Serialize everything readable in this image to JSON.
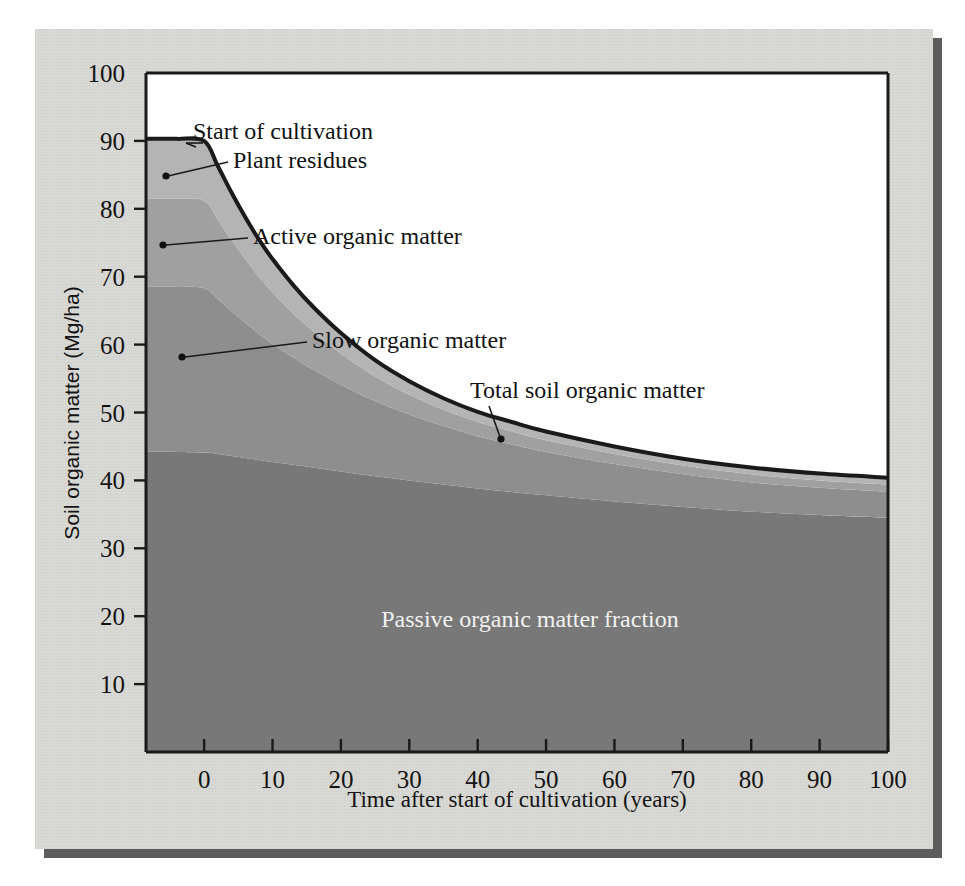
{
  "figure": {
    "caption_present": false,
    "background_color": "#d9d9d5",
    "plot_background": "#ffffff"
  },
  "axes": {
    "y_title": "Soil organic matter (Mg/ha)",
    "x_title": "Time after start of cultivation (years)",
    "y_ticks": [
      "10",
      "20",
      "30",
      "40",
      "50",
      "60",
      "70",
      "80",
      "90",
      "100"
    ],
    "x_ticks": [
      "0",
      "10",
      "20",
      "30",
      "40",
      "50",
      "60",
      "70",
      "80",
      "90",
      "100"
    ]
  },
  "annotations": {
    "start_of_cultivation": "Start of cultivation",
    "plant_residues": "Plant residues",
    "active_organic_matter": "Active organic matter",
    "slow_organic_matter": "Slow organic matter",
    "total_soil_organic_matter": "Total soil organic matter",
    "passive_organic_matter": "Passive organic matter fraction"
  },
  "colors": {
    "plant_residues": "#b4b4b4",
    "active": "#a0a0a0",
    "slow": "#8e8e8e",
    "passive": "#787878",
    "outline": "#1a1a1a",
    "paper": "#d9d9d5",
    "shadow": "#5c5c5c"
  },
  "chart_data": {
    "type": "area",
    "title": "",
    "subtitle": "",
    "xlabel": "Time after start of cultivation (years)",
    "ylabel": "Soil organic matter (Mg/ha)",
    "xlim": [
      -8.5,
      100
    ],
    "ylim": [
      0,
      100
    ],
    "grid": false,
    "legend": "in-plot annotations with leader lines",
    "stacked": true,
    "stack_order_bottom_to_top": [
      "Passive organic matter fraction",
      "Slow organic matter",
      "Active organic matter",
      "Plant residues"
    ],
    "x": [
      -8.5,
      -4,
      0,
      2,
      4,
      6,
      8,
      10,
      13,
      16,
      20,
      25,
      30,
      35,
      40,
      45,
      50,
      60,
      70,
      80,
      90,
      100
    ],
    "series": [
      {
        "name": "Passive organic matter fraction",
        "color": "#787878",
        "values": [
          44.2,
          44.2,
          44.1,
          43.9,
          43.6,
          43.3,
          43.0,
          42.7,
          42.3,
          41.9,
          41.3,
          40.6,
          40.0,
          39.4,
          38.8,
          38.3,
          37.8,
          36.9,
          36.1,
          35.4,
          34.9,
          34.5
        ]
      },
      {
        "name": "Slow organic matter",
        "color": "#8e8e8e",
        "values": [
          24.3,
          24.3,
          24.2,
          22.8,
          21.3,
          19.9,
          18.6,
          17.4,
          15.8,
          14.4,
          12.8,
          11.1,
          9.7,
          8.6,
          7.7,
          7.0,
          6.4,
          5.5,
          4.8,
          4.3,
          4.0,
          3.8
        ]
      },
      {
        "name": "Active organic matter",
        "color": "#a0a0a0",
        "values": [
          13.0,
          13.0,
          12.9,
          11.7,
          10.5,
          9.4,
          8.4,
          7.6,
          6.5,
          5.6,
          4.6,
          3.6,
          2.9,
          2.4,
          2.1,
          1.9,
          1.7,
          1.5,
          1.3,
          1.2,
          1.1,
          1.1
        ]
      },
      {
        "name": "Plant residues",
        "color": "#b4b4b4",
        "values": [
          8.8,
          8.8,
          8.8,
          7.9,
          7.0,
          6.2,
          5.5,
          4.9,
          4.2,
          3.6,
          3.0,
          2.4,
          2.0,
          1.7,
          1.5,
          1.4,
          1.3,
          1.1,
          1.0,
          1.0,
          1.0,
          1.0
        ]
      }
    ],
    "total_line": {
      "name": "Total soil organic matter",
      "color": "#1a1a1a",
      "values": [
        90.3,
        90.3,
        90.0,
        86.3,
        82.4,
        78.8,
        75.5,
        72.6,
        68.8,
        65.5,
        61.7,
        57.7,
        54.6,
        52.1,
        50.1,
        48.6,
        47.2,
        45.0,
        43.2,
        41.9,
        41.0,
        40.4
      ]
    },
    "annotation_points": [
      {
        "label": "Start of cultivation",
        "x": 0,
        "y": 90.0
      },
      {
        "label": "Plant residues",
        "x": -5.6,
        "y": 86.3
      },
      {
        "label": "Active organic matter",
        "x": -6.0,
        "y": 75.4
      },
      {
        "label": "Slow organic matter",
        "x": -5.5,
        "y": 58.9
      },
      {
        "label": "Total soil organic matter",
        "x": 43,
        "y": 47.0
      }
    ]
  }
}
